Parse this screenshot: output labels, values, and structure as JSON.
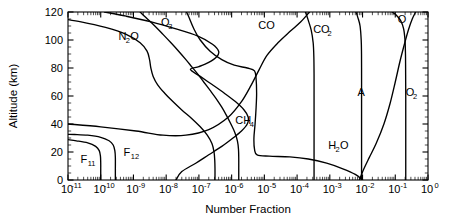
{
  "chart_data": {
    "type": "line",
    "title": "",
    "xlabel": "Number Fraction",
    "ylabel": "Altitude (km)",
    "xscale": "log",
    "yscale": "linear",
    "xlim": [
      1e-11,
      1
    ],
    "ylim": [
      0,
      120
    ],
    "grid": false,
    "legend_position": "inline-labels",
    "xticks": [
      {
        "value": 1e-11,
        "mantissa": "10",
        "exponent": "-11"
      },
      {
        "value": 1e-10,
        "mantissa": "10",
        "exponent": "-10"
      },
      {
        "value": 1e-09,
        "mantissa": "10",
        "exponent": "-9"
      },
      {
        "value": 1e-08,
        "mantissa": "10",
        "exponent": "-8"
      },
      {
        "value": 1e-07,
        "mantissa": "10",
        "exponent": "-7"
      },
      {
        "value": 1e-06,
        "mantissa": "10",
        "exponent": "-6"
      },
      {
        "value": 1e-05,
        "mantissa": "10",
        "exponent": "-5"
      },
      {
        "value": 0.0001,
        "mantissa": "10",
        "exponent": "-4"
      },
      {
        "value": 0.001,
        "mantissa": "10",
        "exponent": "-3"
      },
      {
        "value": 0.01,
        "mantissa": "10",
        "exponent": "-2"
      },
      {
        "value": 0.1,
        "mantissa": "10",
        "exponent": "-1"
      },
      {
        "value": 1,
        "mantissa": "10",
        "exponent": "0"
      }
    ],
    "yticks": [
      0,
      20,
      40,
      60,
      80,
      100,
      120
    ],
    "ytick_labels": [
      "0",
      "20",
      "40",
      "60",
      "80",
      "100",
      "120"
    ],
    "series": [
      {
        "name": "O2",
        "label_main": "O",
        "label_sub": "2",
        "label_x": 0.21,
        "label_y": 60,
        "points": [
          [
            0.209,
            0
          ],
          [
            0.209,
            10
          ],
          [
            0.209,
            20
          ],
          [
            0.209,
            30
          ],
          [
            0.209,
            40
          ],
          [
            0.209,
            50
          ],
          [
            0.209,
            60
          ],
          [
            0.208,
            70
          ],
          [
            0.207,
            80
          ],
          [
            0.205,
            90
          ],
          [
            0.198,
            100
          ],
          [
            0.18,
            108
          ],
          [
            0.145,
            114
          ],
          [
            0.105,
            118
          ],
          [
            0.08,
            120
          ]
        ]
      },
      {
        "name": "A",
        "label_main": "A",
        "label_sub": "",
        "label_x": 0.007,
        "label_y": 60,
        "points": [
          [
            0.00934,
            0
          ],
          [
            0.00934,
            15
          ],
          [
            0.00934,
            30
          ],
          [
            0.00934,
            45
          ],
          [
            0.00934,
            60
          ],
          [
            0.00934,
            75
          ],
          [
            0.0093,
            90
          ],
          [
            0.0091,
            100
          ],
          [
            0.0084,
            110
          ],
          [
            0.0072,
            116
          ],
          [
            0.0063,
            120
          ]
        ]
      },
      {
        "name": "O",
        "label_main": "O",
        "label_sub": "",
        "label_x": 0.12,
        "label_y": 112,
        "points": [
          [
            0.008,
            0
          ],
          [
            0.011,
            8
          ],
          [
            0.016,
            16
          ],
          [
            0.026,
            26
          ],
          [
            0.045,
            40
          ],
          [
            0.07,
            55
          ],
          [
            0.1,
            70
          ],
          [
            0.14,
            85
          ],
          [
            0.19,
            97
          ],
          [
            0.25,
            107
          ],
          [
            0.33,
            115
          ],
          [
            0.42,
            120
          ]
        ]
      },
      {
        "name": "CO2",
        "label_main": "CO",
        "label_sub": "2",
        "label_x": 0.00031,
        "label_y": 105,
        "points": [
          [
            0.00033,
            0
          ],
          [
            0.00033,
            15
          ],
          [
            0.00033,
            30
          ],
          [
            0.00033,
            45
          ],
          [
            0.00033,
            60
          ],
          [
            0.00033,
            75
          ],
          [
            0.000325,
            88
          ],
          [
            0.00031,
            98
          ],
          [
            0.00027,
            107
          ],
          [
            0.00022,
            114
          ],
          [
            0.00018,
            120
          ]
        ]
      },
      {
        "name": "CO",
        "label_main": "CO",
        "label_sub": "",
        "label_x": 6.5e-06,
        "label_y": 108,
        "points": [
          [
            1e-11,
            40
          ],
          [
            1e-10,
            38
          ],
          [
            1.2e-09,
            35
          ],
          [
            8e-09,
            32
          ],
          [
            4e-08,
            32
          ],
          [
            2e-07,
            36
          ],
          [
            8e-07,
            45
          ],
          [
            2e-06,
            56
          ],
          [
            4e-06,
            68
          ],
          [
            7e-06,
            79
          ],
          [
            1.2e-05,
            89
          ],
          [
            2.6e-05,
            98
          ],
          [
            6e-05,
            106
          ],
          [
            0.00013,
            113
          ],
          [
            0.00024,
            120
          ]
        ]
      },
      {
        "name": "H2O",
        "label_main": "H",
        "label_sub": "2",
        "label_tail": "O",
        "label_x": 0.0009,
        "label_y": 22,
        "points": [
          [
            0.01,
            0
          ],
          [
            0.006,
            4
          ],
          [
            0.0025,
            8
          ],
          [
            0.0008,
            12
          ],
          [
            0.00022,
            15
          ],
          [
            6e-05,
            16.5
          ],
          [
            1.4e-05,
            17
          ],
          [
            6e-06,
            18
          ],
          [
            5e-06,
            22
          ],
          [
            4.8e-06,
            30
          ],
          [
            5.2e-06,
            40
          ],
          [
            5.6e-06,
            52
          ],
          [
            5.8e-06,
            62
          ],
          [
            5.6e-06,
            72
          ],
          [
            5e-06,
            78
          ],
          [
            3e-06,
            80
          ],
          [
            1.2e-06,
            82
          ],
          [
            5e-07,
            86
          ],
          [
            2.2e-07,
            92
          ],
          [
            1.1e-07,
            100
          ],
          [
            7e-08,
            108
          ],
          [
            5e-08,
            116
          ],
          [
            4.2e-08,
            120
          ]
        ]
      },
      {
        "name": "CH4",
        "label_main": "CH",
        "label_sub": "4",
        "label_x": 1.3e-06,
        "label_y": 40,
        "points": [
          [
            1.65e-06,
            0
          ],
          [
            1.65e-06,
            8
          ],
          [
            1.65e-06,
            15
          ],
          [
            1.62e-06,
            22
          ],
          [
            1.5e-06,
            28
          ],
          [
            1.25e-06,
            34
          ],
          [
            9.5e-07,
            40
          ],
          [
            7e-07,
            46
          ],
          [
            5e-07,
            52
          ],
          [
            3.4e-07,
            58
          ],
          [
            2.2e-07,
            64
          ],
          [
            1.4e-07,
            70
          ],
          [
            9e-08,
            76
          ],
          [
            6e-08,
            81
          ],
          [
            4e-08,
            86
          ],
          [
            2.4e-08,
            92
          ],
          [
            1.4e-08,
            98
          ],
          [
            8e-09,
            104
          ],
          [
            4.5e-09,
            110
          ],
          [
            2.4e-09,
            116
          ],
          [
            1.6e-09,
            120
          ]
        ]
      },
      {
        "name": "O3",
        "label_main": "O",
        "label_sub": "3",
        "label_x": 7e-09,
        "label_y": 110,
        "points": [
          [
            2e-08,
            0
          ],
          [
            3e-08,
            6
          ],
          [
            8e-08,
            12
          ],
          [
            2e-07,
            18
          ],
          [
            5e-07,
            24
          ],
          [
            1.1e-06,
            30
          ],
          [
            2e-06,
            35
          ],
          [
            3e-06,
            40
          ],
          [
            3.2e-06,
            45
          ],
          [
            2.4e-06,
            50
          ],
          [
            1.3e-06,
            56
          ],
          [
            6e-07,
            62
          ],
          [
            2.6e-07,
            68
          ],
          [
            1.1e-07,
            74
          ],
          [
            5.5e-08,
            79
          ],
          [
            1e-07,
            81
          ],
          [
            2e-07,
            84
          ],
          [
            3.5e-07,
            88
          ],
          [
            4e-07,
            92
          ],
          [
            2.6e-07,
            97
          ],
          [
            9e-08,
            103
          ],
          [
            2e-08,
            108
          ],
          [
            3.5e-09,
            113
          ],
          [
            6e-10,
            117
          ],
          [
            1.3e-10,
            120
          ]
        ]
      },
      {
        "name": "N2O",
        "label_main": "N",
        "label_sub": "2",
        "label_tail": "O",
        "label_x": 3.5e-10,
        "label_y": 100,
        "points": [
          [
            3.1e-07,
            0
          ],
          [
            3.1e-07,
            8
          ],
          [
            3.05e-07,
            14
          ],
          [
            2.9e-07,
            20
          ],
          [
            2.5e-07,
            26
          ],
          [
            1.8e-07,
            32
          ],
          [
            1.1e-07,
            38
          ],
          [
            6e-08,
            44
          ],
          [
            3e-08,
            50
          ],
          [
            1.6e-08,
            56
          ],
          [
            9e-09,
            62
          ],
          [
            5.5e-09,
            68
          ],
          [
            4e-09,
            74
          ],
          [
            3.4e-09,
            80
          ],
          [
            3.1e-09,
            86
          ],
          [
            2.6e-09,
            92
          ],
          [
            1.6e-09,
            98
          ],
          [
            6e-10,
            104
          ],
          [
            1.4e-10,
            109
          ],
          [
            2.5e-11,
            113
          ],
          [
            4e-12,
            116
          ]
        ]
      },
      {
        "name": "F11",
        "label_main": "F",
        "label_sub": "11",
        "label_x": 2.4e-11,
        "label_y": 12,
        "points": [
          [
            1e-10,
            0
          ],
          [
            1e-10,
            6
          ],
          [
            1e-10,
            12
          ],
          [
            9.8e-11,
            17
          ],
          [
            9e-11,
            21
          ],
          [
            7e-11,
            24
          ],
          [
            4e-11,
            26.5
          ],
          [
            1.8e-11,
            28
          ],
          [
            1e-11,
            28.8
          ]
        ]
      },
      {
        "name": "F12",
        "label_main": "F",
        "label_sub": "12",
        "label_x": 5e-10,
        "label_y": 17,
        "points": [
          [
            2.8e-10,
            0
          ],
          [
            2.8e-10,
            8
          ],
          [
            2.8e-10,
            16
          ],
          [
            2.7e-10,
            21
          ],
          [
            2.4e-10,
            25
          ],
          [
            1.8e-10,
            28
          ],
          [
            1e-10,
            30.5
          ],
          [
            4e-11,
            32
          ],
          [
            1.6e-11,
            32.5
          ],
          [
            1e-11,
            32.6
          ]
        ]
      }
    ]
  },
  "axes": {
    "xlabel": "Number Fraction",
    "ylabel": "Altitude (km)"
  }
}
